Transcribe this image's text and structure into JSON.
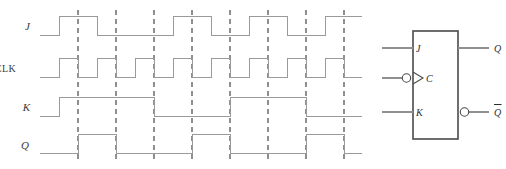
{
  "figure": {
    "type": "digital-timing-diagram",
    "line_color": "#9a9a9a",
    "edge_marker_color": "#8f8f8f",
    "symbol_color": "#4a4a4a",
    "background": "#ffffff"
  },
  "timing": {
    "signal_labels": [
      "J",
      "CLK",
      "K",
      "Q"
    ],
    "rows": [
      {
        "name": "J",
        "label": "J",
        "italic": true,
        "y_high": 16,
        "y_low": 35,
        "label_x": 30,
        "label_y": 30
      },
      {
        "name": "CLK",
        "label": "CLK",
        "italic": false,
        "y_high": 58,
        "y_low": 77,
        "label_x": 16,
        "label_y": 72
      },
      {
        "name": "K",
        "label": "K",
        "italic": true,
        "y_high": 97,
        "y_low": 116,
        "label_x": 30,
        "label_y": 111
      },
      {
        "name": "Q",
        "label": "Q",
        "italic": true,
        "y_high": 134,
        "y_low": 153,
        "label_x": 29,
        "label_y": 149
      }
    ],
    "x_start": 40,
    "x_end": 362,
    "clock_period": 38,
    "clock_cycles": 8,
    "edge_markers_x": [
      78,
      116,
      154,
      192,
      230,
      268,
      306,
      344
    ],
    "edge_marker_top": 10,
    "edge_marker_bottom": 162,
    "waveforms": {
      "J": {
        "initial": 0,
        "transitions_x": [
          59,
          97,
          135,
          173,
          211,
          249,
          287,
          325
        ],
        "levels": [
          0,
          1,
          0,
          0,
          1,
          0,
          1,
          0,
          1
        ]
      },
      "CLK": {
        "initial": 0,
        "transitions_x": [
          59,
          78,
          97,
          116,
          135,
          154,
          173,
          192,
          211,
          230,
          249,
          268,
          287,
          306,
          325,
          344
        ],
        "levels": [
          0,
          1,
          0,
          1,
          0,
          1,
          0,
          1,
          0,
          1,
          0,
          1,
          0,
          1,
          0,
          1,
          0
        ]
      },
      "K": {
        "initial": 0,
        "transitions_x": [
          59,
          154,
          230,
          306
        ],
        "levels": [
          0,
          1,
          0,
          1,
          0
        ]
      },
      "Q": {
        "initial": 0,
        "transitions_x": [
          78,
          116,
          192,
          230,
          306,
          344
        ],
        "levels": [
          0,
          1,
          0,
          1,
          0,
          1,
          0
        ]
      }
    }
  },
  "symbol": {
    "name": "jk-flip-flop",
    "box": {
      "x": 413,
      "y": 31,
      "width": 45,
      "height": 108
    },
    "inputs": [
      {
        "name": "J",
        "label": "J",
        "y": 48,
        "lead_x1": 382,
        "bubble": false,
        "dynamic": false
      },
      {
        "name": "C",
        "label": "C",
        "y": 78,
        "lead_x1": 382,
        "bubble": true,
        "dynamic": true
      },
      {
        "name": "K",
        "label": "K",
        "y": 112,
        "lead_x1": 382,
        "bubble": false,
        "dynamic": false
      }
    ],
    "outputs": [
      {
        "name": "Q",
        "label": "Q",
        "overbar": false,
        "y": 48,
        "lead_x2": 489,
        "bubble": false
      },
      {
        "name": "Qbar",
        "label": "Q",
        "overbar": true,
        "y": 112,
        "lead_x2": 489,
        "bubble": true
      }
    ]
  }
}
